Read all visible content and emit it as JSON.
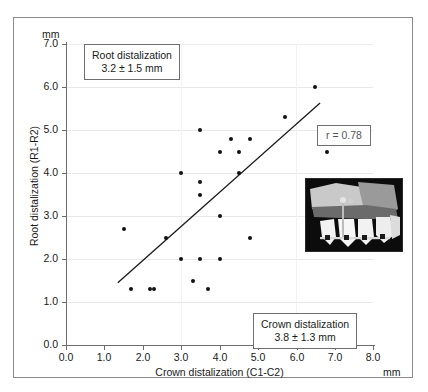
{
  "figure": {
    "y_axis": {
      "unit": "mm",
      "title": "Root distalization (R1-R2)",
      "ticks": [
        "0.0",
        "1.0",
        "2.0",
        "3.0",
        "4.0",
        "5.0",
        "6.0",
        "7.0"
      ]
    },
    "x_axis": {
      "unit": "mm",
      "title": "Crown distalization (C1-C2)",
      "ticks": [
        "0.0",
        "1.0",
        "2.0",
        "3.0",
        "4.0",
        "5.0",
        "6.0",
        "7.0",
        "8.0"
      ]
    },
    "callouts": {
      "root": {
        "line1": "Root distalization",
        "line2": "3.2 ± 1.5 mm"
      },
      "crown": {
        "line1": "Crown distalization",
        "line2": "3.8 ± 1.3 mm"
      },
      "correlation": {
        "line1": "r = 0.78"
      }
    },
    "inset": {
      "name": "orthodontic-radiograph-inset"
    }
  },
  "chart_data": {
    "type": "scatter",
    "title": "",
    "xlabel": "Crown distalization (C1-C2)",
    "ylabel": "Root distalization (R1-R2)",
    "xunit": "mm",
    "yunit": "mm",
    "xlim": [
      0.0,
      8.0
    ],
    "ylim": [
      0.0,
      7.0
    ],
    "xticks": [
      0.0,
      1.0,
      2.0,
      3.0,
      4.0,
      5.0,
      6.0,
      7.0,
      8.0
    ],
    "yticks": [
      0.0,
      1.0,
      2.0,
      3.0,
      4.0,
      5.0,
      6.0,
      7.0
    ],
    "grid": true,
    "legend": "none",
    "correlation_r": 0.78,
    "points": [
      [
        1.5,
        2.7
      ],
      [
        1.7,
        1.3
      ],
      [
        2.2,
        1.3
      ],
      [
        2.3,
        1.3
      ],
      [
        2.6,
        2.5
      ],
      [
        3.0,
        4.0
      ],
      [
        3.0,
        2.0
      ],
      [
        3.3,
        1.5
      ],
      [
        3.5,
        5.0
      ],
      [
        3.5,
        3.8
      ],
      [
        3.5,
        3.5
      ],
      [
        3.5,
        2.0
      ],
      [
        3.7,
        1.3
      ],
      [
        4.0,
        4.5
      ],
      [
        4.0,
        3.0
      ],
      [
        4.0,
        2.0
      ],
      [
        4.3,
        4.8
      ],
      [
        4.5,
        4.5
      ],
      [
        4.5,
        4.0
      ],
      [
        4.8,
        4.8
      ],
      [
        4.8,
        2.5
      ],
      [
        5.7,
        5.3
      ],
      [
        6.5,
        6.0
      ],
      [
        6.8,
        4.5
      ]
    ],
    "regression_line": {
      "x1": 1.35,
      "y1": 1.45,
      "x2": 6.62,
      "y2": 5.63
    },
    "annotations": [
      {
        "text": "Root distalization 3.2 ± 1.5 mm",
        "position": "top-left"
      },
      {
        "text": "Crown distalization 3.8 ± 1.3 mm",
        "position": "bottom-right"
      },
      {
        "text": "r = 0.78",
        "position": "right"
      }
    ]
  }
}
